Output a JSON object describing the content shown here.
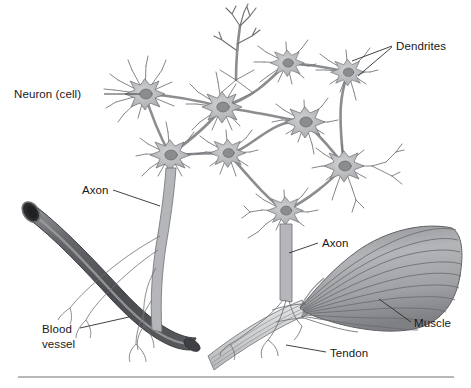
{
  "figure": {
    "style": "grayscale line illustration",
    "background_color": "#ffffff",
    "footer_rule_color": "#6f7173"
  },
  "labels": {
    "neuron_cell": "Neuron (cell)",
    "dendrites": "Dendrites",
    "axon_left": "Axon",
    "axon_right": "Axon",
    "blood_vessel_line1": "Blood",
    "blood_vessel_line2": "vessel",
    "muscle": "Muscle",
    "tendon": "Tendon"
  },
  "colors": {
    "text": "#17181a",
    "leader_line": "#2b2c2e",
    "soma_fill": "#b9bbbd",
    "soma_edge": "#6b6d70",
    "nucleus_fill": "#8a8c8f",
    "nucleus_edge": "#5c5e61",
    "dendrite_stroke": "#6e7073",
    "axon_fill": "#b4b6b9",
    "vessel_dark": "#4a4c4f",
    "vessel_mid": "#63656a",
    "vessel_highlight": "#9b9da1",
    "vessel_lumen": "#2a2b2d",
    "muscle_fill": "#a9abae",
    "muscle_stria": "#6a6c6f",
    "tendon_fill": "#d7d9db",
    "tendon_stroke": "#7b7d80"
  },
  "structures": {
    "neuron_count": 10,
    "soma_positions": [
      {
        "id": "n1",
        "x": 145,
        "y": 94
      },
      {
        "id": "n2",
        "x": 222,
        "y": 107
      },
      {
        "id": "n3",
        "x": 287,
        "y": 63
      },
      {
        "id": "n4",
        "x": 348,
        "y": 72
      },
      {
        "id": "n5",
        "x": 305,
        "y": 122
      },
      {
        "id": "n6",
        "x": 170,
        "y": 155
      },
      {
        "id": "n7",
        "x": 228,
        "y": 153
      },
      {
        "id": "n8",
        "x": 344,
        "y": 166
      },
      {
        "id": "n9",
        "x": 285,
        "y": 211
      },
      {
        "id": "n10",
        "x": 236,
        "y": 80
      }
    ],
    "blood_vessel": {
      "description": "curved tubular vessel running from upper-left to lower-right, cut open end at upper left",
      "start": [
        22,
        213
      ],
      "end": [
        196,
        352
      ]
    },
    "muscle": {
      "description": "fan-shaped striated muscle widening toward the right",
      "narrow_end": [
        300,
        305
      ],
      "wide_end": [
        460,
        262
      ],
      "striation_count": 11
    },
    "tendon": {
      "description": "flat banded tendon extending down-left from muscle",
      "start": [
        300,
        310
      ],
      "end": [
        210,
        368
      ]
    },
    "axon_to_vessel": {
      "from": [
        170,
        160
      ],
      "to": [
        150,
        352
      ]
    },
    "axon_to_muscle": {
      "from": [
        285,
        215
      ],
      "to": [
        290,
        305
      ]
    }
  },
  "leaders": {
    "neuron_cell": {
      "from": [
        104,
        94
      ],
      "to": [
        140,
        94
      ]
    },
    "dendrites": {
      "from": [
        394,
        46
      ],
      "to": [
        352,
        62
      ],
      "second_to": [
        360,
        75
      ]
    },
    "axon_left": {
      "from": [
        112,
        190
      ],
      "to": [
        160,
        205
      ]
    },
    "axon_right": {
      "from": [
        318,
        243
      ],
      "to": [
        290,
        252
      ]
    },
    "blood_vessel": {
      "from": [
        80,
        328
      ],
      "to": [
        128,
        318
      ]
    },
    "muscle": {
      "from": [
        412,
        322
      ],
      "to": [
        380,
        300
      ]
    },
    "tendon": {
      "from": [
        326,
        352
      ],
      "to": [
        286,
        345
      ]
    }
  }
}
